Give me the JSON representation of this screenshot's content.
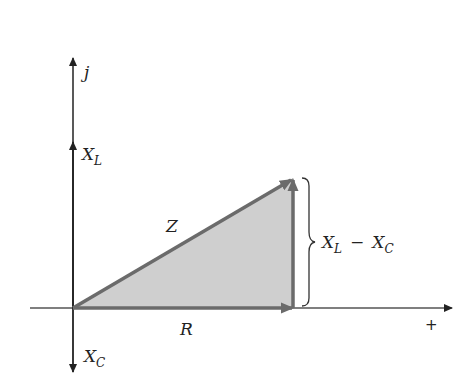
{
  "diagram": {
    "axes": {
      "vertical_label": "j",
      "horizontal_positive_label": "+"
    },
    "labels": {
      "xl_main": "X",
      "xl_sub": "L",
      "xc_main": "X",
      "xc_sub": "C",
      "z": "Z",
      "r": "R",
      "diff_xl_main": "X",
      "diff_xl_sub": "L",
      "diff_minus": "−",
      "diff_xc_main": "X",
      "diff_xc_sub": "C"
    },
    "colors": {
      "axis": "#222222",
      "vector": "#6b6b6b",
      "triangle_fill": "#cfcfcf",
      "background": "#ffffff"
    }
  }
}
